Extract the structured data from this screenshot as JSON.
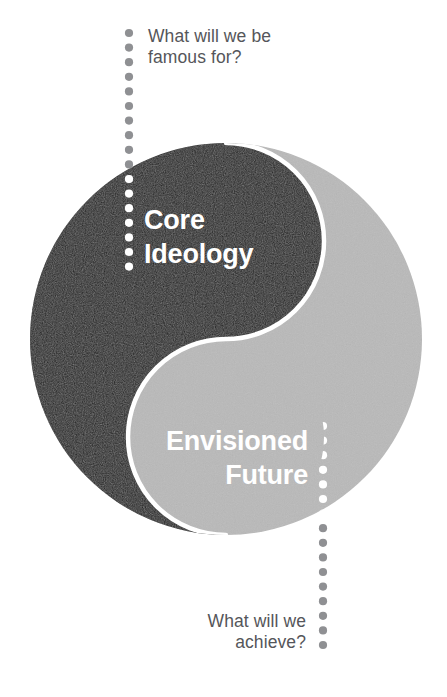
{
  "diagram": {
    "type": "yin-yang-two-halves",
    "title_hidden": "",
    "circle": {
      "cx": 226,
      "cy": 339,
      "r": 196,
      "dark_color": "#1d1d1d",
      "light_color": "#b9b9b9",
      "separator_color": "#ffffff"
    },
    "halves": [
      {
        "name": "core-ideology",
        "label": "Core\nIdeology",
        "fill": "#1d1d1d",
        "text_color": "#ffffff",
        "side": "left"
      },
      {
        "name": "envisioned-future",
        "label": "Envisioned\nFuture",
        "fill": "#b9b9b9",
        "text_color": "#ffffff",
        "side": "right"
      }
    ],
    "callouts": [
      {
        "name": "top-question",
        "text": "What will we be\nfamous for?",
        "color": "#55565a",
        "align": "left",
        "connector": {
          "name": "dotted-leader-top",
          "style": "dotted",
          "orientation": "vertical",
          "x": 129,
          "y_start": 33,
          "y_end": 271,
          "dot_radius": 4.1,
          "dot_spacing": 14.6,
          "color_outside": "#8f9093",
          "color_inside": "#ffffff"
        }
      },
      {
        "name": "bottom-question",
        "text": "What will we\nachieve?",
        "color": "#55565a",
        "align": "right",
        "connector": {
          "name": "dotted-leader-bottom",
          "style": "dotted",
          "orientation": "vertical",
          "x": 323,
          "y_start": 426,
          "y_end": 649,
          "dot_radius": 4.1,
          "dot_spacing": 14.6,
          "color_outside": "#8f9093",
          "color_inside": "#ffffff"
        }
      }
    ]
  }
}
